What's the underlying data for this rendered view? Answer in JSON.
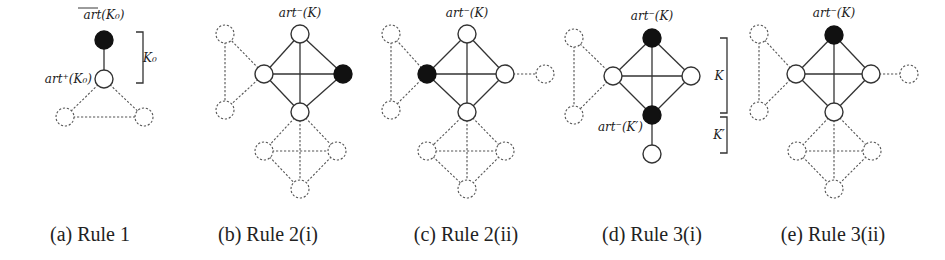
{
  "figure": {
    "node_radius": 9,
    "panels": [
      {
        "id": "a",
        "caption": "(a) Rule 1",
        "caption_x": 90,
        "nodes": [
          {
            "id": "a_top",
            "x": 104,
            "y": 40,
            "style": "black",
            "name": "node-art-bar-k0"
          },
          {
            "id": "a_mid",
            "x": 104,
            "y": 79,
            "style": "white",
            "name": "node-art-plus-k0"
          },
          {
            "id": "a_l",
            "x": 65,
            "y": 117,
            "style": "dashed",
            "name": "node-dashed"
          },
          {
            "id": "a_r",
            "x": 144,
            "y": 117,
            "style": "dashed",
            "name": "node-dashed"
          }
        ],
        "edges": [
          {
            "from": "a_top",
            "to": "a_mid",
            "style": "solid"
          },
          {
            "from": "a_mid",
            "to": "a_l",
            "style": "dashed"
          },
          {
            "from": "a_mid",
            "to": "a_r",
            "style": "dashed"
          },
          {
            "from": "a_l",
            "to": "a_r",
            "style": "dashed"
          }
        ],
        "labels": [
          {
            "text": "art(K₀)",
            "x": 104,
            "y": 19,
            "anchor": "middle",
            "overline": true,
            "name": "label-art-bar-k0"
          },
          {
            "text": "art⁺(K₀)",
            "x": 92,
            "y": 83,
            "anchor": "end",
            "name": "label-art-plus-k0"
          },
          {
            "text": "K₀",
            "x": 150,
            "y": 62,
            "anchor": "middle",
            "name": "label-k0"
          }
        ],
        "brackets": [
          {
            "x": 143,
            "y1": 32,
            "y2": 83,
            "name": "bracket-k0"
          }
        ]
      },
      {
        "id": "b",
        "caption": "(b) Rule 2(i)",
        "caption_x": 268,
        "nodes": [
          {
            "id": "b_t",
            "x": 300,
            "y": 34,
            "style": "white",
            "name": "node-art-minus-k"
          },
          {
            "id": "b_l",
            "x": 264,
            "y": 74,
            "style": "white",
            "name": "node"
          },
          {
            "id": "b_r",
            "x": 343,
            "y": 74,
            "style": "black",
            "name": "node-black"
          },
          {
            "id": "b_b",
            "x": 300,
            "y": 112,
            "style": "white",
            "name": "node"
          },
          {
            "id": "b_tl",
            "x": 225,
            "y": 34,
            "style": "dashed",
            "name": "node-dashed"
          },
          {
            "id": "b_bl",
            "x": 225,
            "y": 110,
            "style": "dashed",
            "name": "node-dashed"
          },
          {
            "id": "b_ql",
            "x": 264,
            "y": 151,
            "style": "dashed",
            "name": "node-dashed"
          },
          {
            "id": "b_qr",
            "x": 337,
            "y": 151,
            "style": "dashed",
            "name": "node-dashed"
          },
          {
            "id": "b_qb",
            "x": 300,
            "y": 189,
            "style": "dashed",
            "name": "node-dashed"
          }
        ],
        "edges": [
          {
            "from": "b_t",
            "to": "b_l",
            "style": "solid"
          },
          {
            "from": "b_t",
            "to": "b_r",
            "style": "solid"
          },
          {
            "from": "b_t",
            "to": "b_b",
            "style": "solid"
          },
          {
            "from": "b_l",
            "to": "b_r",
            "style": "solid"
          },
          {
            "from": "b_l",
            "to": "b_b",
            "style": "solid"
          },
          {
            "from": "b_r",
            "to": "b_b",
            "style": "solid"
          },
          {
            "from": "b_l",
            "to": "b_tl",
            "style": "dashed"
          },
          {
            "from": "b_l",
            "to": "b_bl",
            "style": "dashed"
          },
          {
            "from": "b_tl",
            "to": "b_bl",
            "style": "dashed"
          },
          {
            "from": "b_b",
            "to": "b_ql",
            "style": "dashed"
          },
          {
            "from": "b_b",
            "to": "b_qr",
            "style": "dashed"
          },
          {
            "from": "b_b",
            "to": "b_qb",
            "style": "dashed"
          },
          {
            "from": "b_ql",
            "to": "b_qr",
            "style": "dashed"
          },
          {
            "from": "b_ql",
            "to": "b_qb",
            "style": "dashed"
          },
          {
            "from": "b_qr",
            "to": "b_qb",
            "style": "dashed"
          }
        ],
        "labels": [
          {
            "text": "art⁻(K)",
            "x": 300,
            "y": 17,
            "anchor": "middle",
            "name": "label-art-minus-k"
          }
        ],
        "brackets": []
      },
      {
        "id": "c",
        "caption": "(c) Rule 2(ii)",
        "caption_x": 466,
        "nodes": [
          {
            "id": "c_t",
            "x": 467,
            "y": 34,
            "style": "white",
            "name": "node-art-minus-k"
          },
          {
            "id": "c_l",
            "x": 427,
            "y": 74,
            "style": "black",
            "name": "node-black"
          },
          {
            "id": "c_r",
            "x": 505,
            "y": 74,
            "style": "white",
            "name": "node"
          },
          {
            "id": "c_b",
            "x": 467,
            "y": 112,
            "style": "white",
            "name": "node"
          },
          {
            "id": "c_tl",
            "x": 391,
            "y": 34,
            "style": "dashed",
            "name": "node-dashed"
          },
          {
            "id": "c_bl",
            "x": 391,
            "y": 110,
            "style": "dashed",
            "name": "node-dashed"
          },
          {
            "id": "c_fr",
            "x": 545,
            "y": 74,
            "style": "dashed",
            "name": "node-dashed"
          },
          {
            "id": "c_ql",
            "x": 427,
            "y": 151,
            "style": "dashed",
            "name": "node-dashed"
          },
          {
            "id": "c_qr",
            "x": 505,
            "y": 151,
            "style": "dashed",
            "name": "node-dashed"
          },
          {
            "id": "c_qb",
            "x": 467,
            "y": 189,
            "style": "dashed",
            "name": "node-dashed"
          }
        ],
        "edges": [
          {
            "from": "c_t",
            "to": "c_l",
            "style": "solid"
          },
          {
            "from": "c_t",
            "to": "c_r",
            "style": "solid"
          },
          {
            "from": "c_t",
            "to": "c_b",
            "style": "solid"
          },
          {
            "from": "c_l",
            "to": "c_r",
            "style": "solid"
          },
          {
            "from": "c_l",
            "to": "c_b",
            "style": "solid"
          },
          {
            "from": "c_r",
            "to": "c_b",
            "style": "solid"
          },
          {
            "from": "c_l",
            "to": "c_tl",
            "style": "dashed"
          },
          {
            "from": "c_l",
            "to": "c_bl",
            "style": "dashed"
          },
          {
            "from": "c_tl",
            "to": "c_bl",
            "style": "dashed"
          },
          {
            "from": "c_r",
            "to": "c_fr",
            "style": "dashed"
          },
          {
            "from": "c_b",
            "to": "c_ql",
            "style": "dashed"
          },
          {
            "from": "c_b",
            "to": "c_qr",
            "style": "dashed"
          },
          {
            "from": "c_b",
            "to": "c_qb",
            "style": "dashed"
          },
          {
            "from": "c_ql",
            "to": "c_qr",
            "style": "dashed"
          },
          {
            "from": "c_ql",
            "to": "c_qb",
            "style": "dashed"
          },
          {
            "from": "c_qr",
            "to": "c_qb",
            "style": "dashed"
          }
        ],
        "labels": [
          {
            "text": "art⁻(K)",
            "x": 467,
            "y": 17,
            "anchor": "middle",
            "name": "label-art-minus-k"
          }
        ],
        "brackets": []
      },
      {
        "id": "d",
        "caption": "(d) Rule 3(i)",
        "caption_x": 652,
        "nodes": [
          {
            "id": "d_t",
            "x": 652,
            "y": 38,
            "style": "black",
            "name": "node-art-minus-k"
          },
          {
            "id": "d_l",
            "x": 613,
            "y": 76,
            "style": "white",
            "name": "node"
          },
          {
            "id": "d_r",
            "x": 691,
            "y": 76,
            "style": "white",
            "name": "node"
          },
          {
            "id": "d_b",
            "x": 652,
            "y": 115,
            "style": "black",
            "name": "node-art-minus-k-prime"
          },
          {
            "id": "d_p",
            "x": 652,
            "y": 154,
            "style": "white",
            "name": "node-pendant"
          },
          {
            "id": "d_tl",
            "x": 574,
            "y": 38,
            "style": "dashed",
            "name": "node-dashed"
          },
          {
            "id": "d_bl",
            "x": 574,
            "y": 115,
            "style": "dashed",
            "name": "node-dashed"
          }
        ],
        "edges": [
          {
            "from": "d_t",
            "to": "d_l",
            "style": "solid"
          },
          {
            "from": "d_t",
            "to": "d_r",
            "style": "solid"
          },
          {
            "from": "d_t",
            "to": "d_b",
            "style": "solid"
          },
          {
            "from": "d_l",
            "to": "d_r",
            "style": "solid"
          },
          {
            "from": "d_l",
            "to": "d_b",
            "style": "solid"
          },
          {
            "from": "d_r",
            "to": "d_b",
            "style": "solid"
          },
          {
            "from": "d_b",
            "to": "d_p",
            "style": "solid"
          },
          {
            "from": "d_l",
            "to": "d_tl",
            "style": "dashed"
          },
          {
            "from": "d_l",
            "to": "d_bl",
            "style": "dashed"
          },
          {
            "from": "d_tl",
            "to": "d_bl",
            "style": "dashed"
          }
        ],
        "labels": [
          {
            "text": "art⁻(K)",
            "x": 652,
            "y": 20,
            "anchor": "middle",
            "name": "label-art-minus-k"
          },
          {
            "text": "art⁻(K′)",
            "x": 643,
            "y": 131,
            "anchor": "end",
            "name": "label-art-minus-k-prime"
          },
          {
            "text": "K",
            "x": 719,
            "y": 80,
            "anchor": "middle",
            "name": "label-k"
          },
          {
            "text": "K′",
            "x": 719,
            "y": 139,
            "anchor": "middle",
            "name": "label-k-prime"
          }
        ],
        "brackets": [
          {
            "x": 727,
            "y1": 38,
            "y2": 113,
            "name": "bracket-k"
          },
          {
            "x": 727,
            "y1": 117,
            "y2": 153,
            "name": "bracket-k-prime"
          }
        ]
      },
      {
        "id": "e",
        "caption": "(e) Rule 3(ii)",
        "caption_x": 833,
        "nodes": [
          {
            "id": "e_t",
            "x": 834,
            "y": 35,
            "style": "black",
            "name": "node-art-minus-k"
          },
          {
            "id": "e_l",
            "x": 796,
            "y": 74,
            "style": "white",
            "name": "node"
          },
          {
            "id": "e_r",
            "x": 871,
            "y": 74,
            "style": "white",
            "name": "node"
          },
          {
            "id": "e_b",
            "x": 834,
            "y": 112,
            "style": "white",
            "name": "node"
          },
          {
            "id": "e_fr",
            "x": 909,
            "y": 74,
            "style": "dashed",
            "name": "node-dashed"
          },
          {
            "id": "e_tl",
            "x": 759,
            "y": 34,
            "style": "dashed",
            "name": "node-dashed"
          },
          {
            "id": "e_bl",
            "x": 759,
            "y": 111,
            "style": "dashed",
            "name": "node-dashed"
          },
          {
            "id": "e_ql",
            "x": 797,
            "y": 151,
            "style": "dashed",
            "name": "node-dashed"
          },
          {
            "id": "e_qr",
            "x": 872,
            "y": 151,
            "style": "dashed",
            "name": "node-dashed"
          },
          {
            "id": "e_qb",
            "x": 834,
            "y": 189,
            "style": "dashed",
            "name": "node-dashed"
          }
        ],
        "edges": [
          {
            "from": "e_t",
            "to": "e_l",
            "style": "solid"
          },
          {
            "from": "e_t",
            "to": "e_r",
            "style": "solid"
          },
          {
            "from": "e_t",
            "to": "e_b",
            "style": "solid"
          },
          {
            "from": "e_l",
            "to": "e_r",
            "style": "solid"
          },
          {
            "from": "e_l",
            "to": "e_b",
            "style": "solid"
          },
          {
            "from": "e_r",
            "to": "e_b",
            "style": "solid"
          },
          {
            "from": "e_r",
            "to": "e_fr",
            "style": "dashed"
          },
          {
            "from": "e_l",
            "to": "e_tl",
            "style": "dashed"
          },
          {
            "from": "e_l",
            "to": "e_bl",
            "style": "dashed"
          },
          {
            "from": "e_tl",
            "to": "e_bl",
            "style": "dashed"
          },
          {
            "from": "e_b",
            "to": "e_ql",
            "style": "dashed"
          },
          {
            "from": "e_b",
            "to": "e_qr",
            "style": "dashed"
          },
          {
            "from": "e_b",
            "to": "e_qb",
            "style": "dashed"
          },
          {
            "from": "e_ql",
            "to": "e_qr",
            "style": "dashed"
          },
          {
            "from": "e_ql",
            "to": "e_qb",
            "style": "dashed"
          },
          {
            "from": "e_qr",
            "to": "e_qb",
            "style": "dashed"
          }
        ],
        "labels": [
          {
            "text": "art⁻(K)",
            "x": 834,
            "y": 17,
            "anchor": "middle",
            "name": "label-art-minus-k"
          }
        ],
        "brackets": []
      }
    ],
    "caption_y": 241,
    "colors": {
      "node_fill_black": "#111111",
      "node_fill_white": "#ffffff",
      "stroke": "#333333",
      "dashed_stroke": "#555555"
    }
  }
}
